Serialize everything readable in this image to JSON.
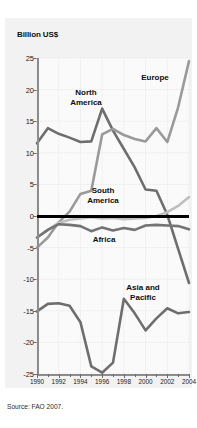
{
  "figure": {
    "source_note": "Source: FAO 2007."
  },
  "chart_data": {
    "type": "line",
    "title": "",
    "ylabel": "Billion US$",
    "xlabel": "",
    "grid": true,
    "legend_position": "inline-annotations",
    "ylim": [
      -25,
      25
    ],
    "xlim": [
      1990,
      2004
    ],
    "yticks": [
      25,
      20,
      15,
      10,
      5,
      0,
      -5,
      -10,
      -15,
      -20,
      -25
    ],
    "ytick_labels": [
      "25",
      "20",
      "15",
      "10",
      "5",
      "0",
      "-5",
      "-10",
      "-15",
      "-20",
      "-25"
    ],
    "xticks": [
      1990,
      1992,
      1994,
      1996,
      1998,
      2000,
      2002,
      2004
    ],
    "xtick_labels": [
      "1990",
      "1992",
      "1994",
      "1996",
      "1998",
      "2000",
      "2002",
      "2004"
    ],
    "x_minor_ticks": [
      1991,
      1993,
      1995,
      1997,
      1999,
      2001,
      2003
    ],
    "x": [
      1990,
      1991,
      1992,
      1993,
      1994,
      1995,
      1996,
      1997,
      1998,
      1999,
      2000,
      2001,
      2002,
      2003,
      2004
    ],
    "zero_line": 0,
    "series": [
      {
        "name": "North America",
        "color": "#6e6e6e",
        "label_x": 86,
        "label_y": 88,
        "values": [
          11.5,
          13.9,
          13.0,
          12.4,
          11.7,
          11.8,
          17.0,
          13.5,
          10.6,
          7.7,
          4.2,
          4.0,
          0.2,
          -5.2,
          -10.6
        ]
      },
      {
        "name": "Europe",
        "color": "#9a9a9a",
        "label_x": 155,
        "label_y": 73,
        "values": [
          -5.0,
          -3.4,
          -1.0,
          0.7,
          3.5,
          4.0,
          12.9,
          13.8,
          12.8,
          12.2,
          11.8,
          13.9,
          11.7,
          17.2,
          24.5
        ]
      },
      {
        "name": "South America",
        "color": "#bfbfbf",
        "label_x": 103,
        "label_y": 186,
        "values": [
          -3.4,
          -2.2,
          -1.1,
          -0.6,
          -0.4,
          -0.2,
          -0.4,
          -0.3,
          -0.5,
          -0.4,
          -0.3,
          0.0,
          0.6,
          1.6,
          3.0
        ]
      },
      {
        "name": "Africa",
        "color": "#737373",
        "label_x": 104,
        "label_y": 235,
        "values": [
          -3.4,
          -2.2,
          -1.3,
          -1.4,
          -1.6,
          -2.4,
          -1.8,
          -2.3,
          -1.9,
          -2.2,
          -1.5,
          -1.4,
          -1.5,
          -1.6,
          -2.1
        ]
      },
      {
        "name": "Asia and Pacific",
        "color": "#6e6e6e",
        "label_x": 143,
        "label_y": 283,
        "values": [
          -15.1,
          -13.9,
          -13.8,
          -14.2,
          -16.8,
          -23.8,
          -24.8,
          -23.2,
          -13.1,
          -15.4,
          -18.1,
          -16.2,
          -14.6,
          -15.4,
          -15.2
        ]
      }
    ]
  }
}
